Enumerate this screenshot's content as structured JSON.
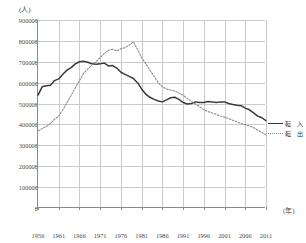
{
  "axes": {
    "y_unit_label": "(人)",
    "x_unit_label": "(年)",
    "y_ticks": [
      "900000",
      "800000",
      "700000",
      "600000",
      "500000",
      "400000",
      "300000",
      "200000",
      "100000",
      "0"
    ],
    "x_ticks": [
      "1956",
      "1961",
      "1966",
      "1971",
      "1976",
      "1981",
      "1986",
      "1991",
      "1996",
      "2001",
      "2006",
      "2011"
    ]
  },
  "legend": {
    "position": "right",
    "items": [
      {
        "label": "転　入",
        "style": "solid",
        "color": "#3a3a3a"
      },
      {
        "label": "転　出",
        "style": "dotted",
        "color": "#8c8c8c"
      }
    ]
  },
  "chart_data": {
    "type": "line",
    "title": "",
    "xlabel": "(年)",
    "ylabel": "(人)",
    "ylim": [
      0,
      900000
    ],
    "xlim": [
      1956,
      2011
    ],
    "grid": true,
    "legend_position": "right",
    "x": [
      1956,
      1957,
      1958,
      1959,
      1960,
      1961,
      1962,
      1963,
      1964,
      1965,
      1966,
      1967,
      1968,
      1969,
      1970,
      1971,
      1972,
      1973,
      1974,
      1975,
      1976,
      1977,
      1978,
      1979,
      1980,
      1981,
      1982,
      1983,
      1984,
      1985,
      1986,
      1987,
      1988,
      1989,
      1990,
      1991,
      1992,
      1993,
      1994,
      1995,
      1996,
      1997,
      1998,
      1999,
      2000,
      2001,
      2002,
      2003,
      2004,
      2005,
      2006,
      2007,
      2008,
      2009,
      2010,
      2011
    ],
    "series": [
      {
        "name": "転　入",
        "style": "solid",
        "color": "#3a3a3a",
        "values": [
          540000,
          580000,
          585000,
          588000,
          610000,
          618000,
          640000,
          660000,
          672000,
          690000,
          700000,
          702000,
          698000,
          690000,
          688000,
          690000,
          694000,
          680000,
          682000,
          670000,
          650000,
          640000,
          630000,
          620000,
          600000,
          570000,
          545000,
          530000,
          520000,
          512000,
          508000,
          518000,
          528000,
          530000,
          520000,
          505000,
          498000,
          500000,
          508000,
          505000,
          505000,
          510000,
          508000,
          505000,
          508000,
          508000,
          500000,
          495000,
          492000,
          490000,
          478000,
          470000,
          455000,
          440000,
          432000,
          418000
        ]
      },
      {
        "name": "転　出",
        "style": "dotted",
        "color": "#8c8c8c",
        "values": [
          370000,
          380000,
          390000,
          405000,
          425000,
          440000,
          470000,
          505000,
          540000,
          575000,
          610000,
          645000,
          665000,
          685000,
          700000,
          720000,
          740000,
          755000,
          760000,
          752000,
          762000,
          768000,
          780000,
          795000,
          760000,
          720000,
          690000,
          660000,
          630000,
          600000,
          580000,
          570000,
          565000,
          560000,
          550000,
          540000,
          525000,
          510000,
          498000,
          485000,
          470000,
          462000,
          455000,
          448000,
          440000,
          435000,
          428000,
          420000,
          412000,
          405000,
          398000,
          392000,
          385000,
          372000,
          362000,
          350000
        ]
      }
    ]
  }
}
